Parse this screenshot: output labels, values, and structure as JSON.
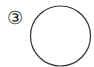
{
  "label": {
    "text": "③"
  },
  "figure": {
    "shape": "circle",
    "stroke": "#333333",
    "fill": "#ffffff",
    "cx": 60.5,
    "cy": 36,
    "r": 30
  }
}
